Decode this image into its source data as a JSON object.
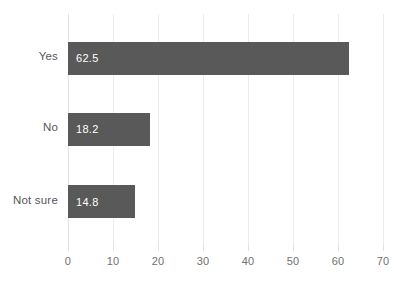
{
  "chart_data": {
    "type": "bar",
    "orientation": "horizontal",
    "title": "",
    "xlabel": "",
    "ylabel": "",
    "categories": [
      "Yes",
      "No",
      "Not sure"
    ],
    "values": [
      62.5,
      18.2,
      14.8
    ],
    "value_labels": [
      "62.5",
      "18.2",
      "14.8"
    ],
    "xlim": [
      0,
      70
    ],
    "xticks": [
      0,
      10,
      20,
      30,
      40,
      50,
      60,
      70
    ],
    "xtick_labels": [
      "0",
      "10",
      "20",
      "30",
      "40",
      "50",
      "60",
      "70"
    ],
    "grid": "vertical",
    "legend": "none",
    "bar_color": "#595959",
    "value_label_color": "#ffffff",
    "axis_label_color": "#6f7072",
    "gridline_color": "#ececed",
    "background": "#ffffff"
  }
}
